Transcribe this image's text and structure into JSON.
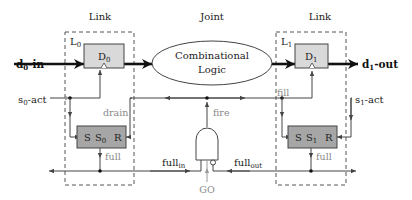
{
  "diagram": {
    "sections": {
      "left_link": "Link",
      "joint": "Joint",
      "right_link": "Link"
    },
    "left_link": {
      "name": "L",
      "name_sub": "0",
      "data_register": "D",
      "data_register_sub": "0",
      "state": {
        "s": "S",
        "name": "S",
        "name_sub": "0",
        "r": "R"
      },
      "full_label": "full"
    },
    "right_link": {
      "name": "L",
      "name_sub": "1",
      "data_register": "D",
      "data_register_sub": "1",
      "state": {
        "s": "S",
        "name": "S",
        "name_sub": "1",
        "r": "R"
      },
      "full_label": "full"
    },
    "joint": {
      "logic_line1": "Combinational",
      "logic_line2": "Logic",
      "gate_output": "fire",
      "gate_enable": "GO"
    },
    "signals": {
      "input": "d",
      "input_sub": "0",
      "input_suffix": "-in",
      "output": "d",
      "output_sub": "1",
      "output_suffix": "-out",
      "s0_act": "s",
      "s0_act_sub": "0",
      "s0_act_suffix": "-act",
      "s1_act": "s",
      "s1_act_sub": "1",
      "s1_act_suffix": "-act",
      "drain": "drain",
      "fill": "fill",
      "full_in": "full",
      "full_in_sub": "in",
      "full_out": "full",
      "full_out_sub": "out"
    },
    "colors": {
      "register_fill": "#d9d9d9",
      "state_fill": "#a6a6a6",
      "wire": "#444444",
      "gray_label": "#8a8a8a",
      "dashed_border": "#555555"
    }
  }
}
